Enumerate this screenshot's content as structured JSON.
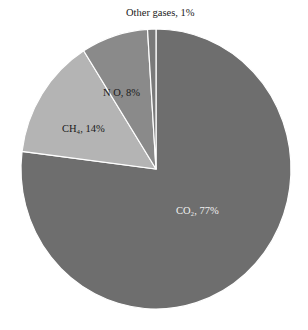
{
  "chart_data": {
    "type": "pie",
    "title": "",
    "categories": [
      "CO2",
      "CH4",
      "N2O",
      "Other gases"
    ],
    "values": [
      77,
      14,
      8,
      1
    ],
    "unit": "%",
    "start_angle_deg": 0,
    "direction": "clockwise",
    "slices": [
      {
        "name": "CO2",
        "label": "CO₂, 77%",
        "value": 77,
        "color": "#6e6e6e",
        "label_color": "#f0f0f0"
      },
      {
        "name": "CH4",
        "label": "CH₄, 14%",
        "value": 14,
        "color": "#b4b4b4",
        "label_color": "#1a1a1a"
      },
      {
        "name": "N2O",
        "label": "N O, 8%",
        "value": 8,
        "color": "#8a8a8a",
        "label_color": "#1a1a1a"
      },
      {
        "name": "Other gases",
        "label": "Other gases, 1%",
        "value": 1,
        "color": "#7a7a7a",
        "label_color": "#1a1a1a"
      }
    ],
    "legend": "none (data labels on slices)",
    "grid": false
  },
  "labels": {
    "co2": "CO₂, 77%",
    "ch4": "CH₄, 14%",
    "n2o": "N O, 8%",
    "other": "Other gases, 1%"
  }
}
